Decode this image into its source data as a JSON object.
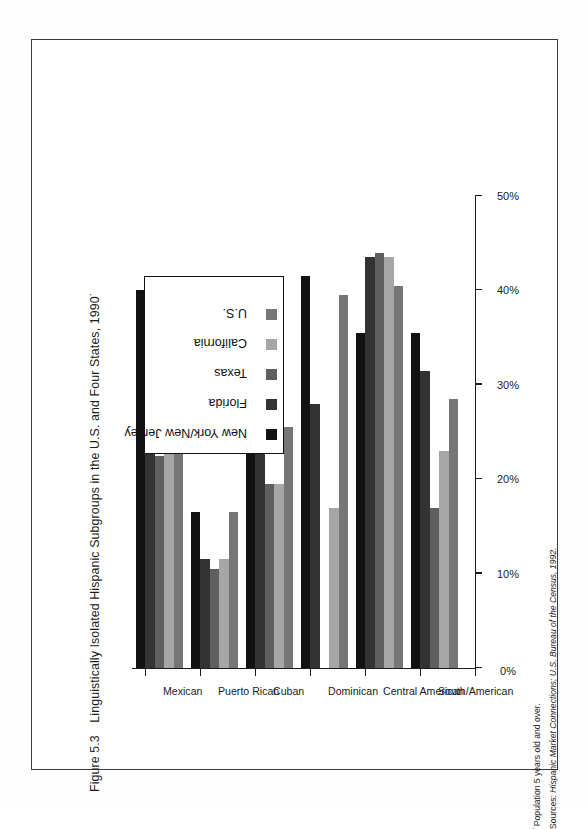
{
  "figure": {
    "number": "Figure 5.3",
    "title": "Linguistically Isolated Hispanic Subgroups in the U.S. and Four States, 1990˙"
  },
  "footnotes": {
    "note": "˙Population 5 years old and over.",
    "source_label": "Sources:",
    "source_text": " Hispanic Market Connections; U.S. Bureau of the Census, 1992."
  },
  "legend": {
    "items": [
      {
        "label": "New York/New Jersey",
        "color": "#121212"
      },
      {
        "label": "Florida",
        "color": "#333333"
      },
      {
        "label": "Texas",
        "color": "#5f5f5f"
      },
      {
        "label": "California",
        "color": "#a6a6a6"
      },
      {
        "label": "U.S.",
        "color": "#767676"
      }
    ]
  },
  "chart_data": {
    "type": "bar",
    "title": "Figure 5.3  Linguistically Isolated Hispanic Subgroups in the U.S. and Four States, 1990˙",
    "xlabel": "",
    "ylabel": "",
    "ylim": [
      0,
      50
    ],
    "grid": false,
    "legend_position": "inside-top-left",
    "tick_labels": [
      "0%",
      "10%",
      "20%",
      "30%",
      "40%",
      "50%"
    ],
    "ticks": [
      0,
      10,
      20,
      30,
      40,
      50
    ],
    "categories": [
      "Mexican",
      "Puerto Rican",
      "Cuban",
      "Dominican",
      "Central American",
      "South/American"
    ],
    "series": [
      {
        "name": "New York/New Jersey",
        "color": "#121212",
        "values": [
          40.0,
          16.5,
          24.5,
          41.5,
          35.5,
          35.5
        ]
      },
      {
        "name": "Florida",
        "color": "#333333",
        "values": [
          23.5,
          11.5,
          31.0,
          28.0,
          43.5,
          31.5
        ]
      },
      {
        "name": "Texas",
        "color": "#5f5f5f",
        "values": [
          22.5,
          10.5,
          19.5,
          null,
          44.0,
          17.0
        ]
      },
      {
        "name": "California",
        "color": "#a6a6a6",
        "values": [
          26.5,
          11.5,
          19.5,
          17.0,
          43.5,
          23.0
        ]
      },
      {
        "name": "U.S.",
        "color": "#767676",
        "values": [
          23.5,
          16.5,
          25.5,
          39.5,
          40.5,
          28.5
        ]
      }
    ]
  }
}
